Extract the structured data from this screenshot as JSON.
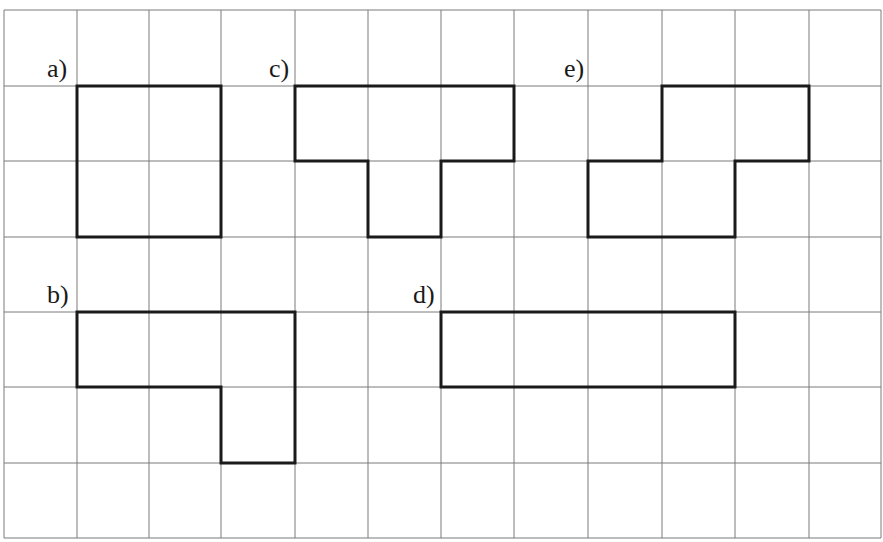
{
  "figure": {
    "grid": {
      "columns": 12,
      "rows": 7,
      "x_lines": [
        4,
        77,
        149,
        221,
        295,
        368,
        441,
        514,
        588,
        662,
        735,
        809,
        881
      ],
      "y_lines": [
        10,
        86,
        161,
        237,
        312,
        387,
        463,
        538
      ],
      "line_color": "#7a7a7a",
      "shape_color": "#1a1a1a"
    },
    "shapes": [
      {
        "label": "a)",
        "label_pos": [
          47,
          80
        ],
        "cells": 4,
        "vertices": [
          [
            1,
            1
          ],
          [
            3,
            1
          ],
          [
            3,
            3
          ],
          [
            1,
            3
          ]
        ]
      },
      {
        "label": "b)",
        "label_pos": [
          47,
          306
        ],
        "cells": 4,
        "vertices": [
          [
            1,
            4
          ],
          [
            4,
            4
          ],
          [
            4,
            6
          ],
          [
            3,
            6
          ],
          [
            3,
            5
          ],
          [
            1,
            5
          ]
        ]
      },
      {
        "label": "c)",
        "label_pos": [
          269,
          80
        ],
        "cells": 4,
        "vertices": [
          [
            4,
            1
          ],
          [
            7,
            1
          ],
          [
            7,
            2
          ],
          [
            6,
            2
          ],
          [
            6,
            3
          ],
          [
            5,
            3
          ],
          [
            5,
            2
          ],
          [
            4,
            2
          ]
        ]
      },
      {
        "label": "d)",
        "label_pos": [
          413,
          306
        ],
        "cells": 4,
        "vertices": [
          [
            6,
            4
          ],
          [
            10,
            4
          ],
          [
            10,
            5
          ],
          [
            6,
            5
          ]
        ]
      },
      {
        "label": "e)",
        "label_pos": [
          564,
          80
        ],
        "cells": 4,
        "vertices": [
          [
            9,
            1
          ],
          [
            11,
            1
          ],
          [
            11,
            2
          ],
          [
            10,
            2
          ],
          [
            10,
            3
          ],
          [
            8,
            3
          ],
          [
            8,
            2
          ],
          [
            9,
            2
          ]
        ]
      }
    ]
  }
}
